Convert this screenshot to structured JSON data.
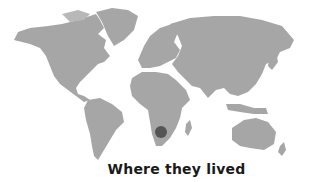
{
  "map": {
    "type": "world-map",
    "land_color": "#a6a6a6",
    "marker": {
      "label": "Southern Africa",
      "cx": 161,
      "cy": 132,
      "r": 6,
      "color": "#555555"
    }
  },
  "caption": "Where they lived"
}
